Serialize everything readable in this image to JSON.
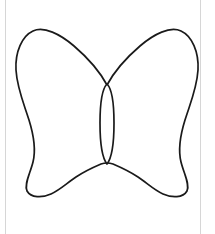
{
  "page": {
    "background_color": "#ffffff",
    "width": 215,
    "height": 234,
    "rule_color": "#d6d6d6",
    "rule_left_x": 5,
    "rule_right_x": 200
  },
  "figure": {
    "name": "butterfly-outline",
    "stroke_color": "#1a1a1a",
    "fill_color": "#ffffff",
    "stroke_width": 1.7,
    "viewbox": "0 0 215 234",
    "parts": [
      {
        "name": "wings",
        "label": "Butterfly wings outline",
        "path": "M 107 85 C 100 72 88 58 74 46 C 60 34 44 26 33 31 C 22 36 15 52 16 70 C 17 88 24 104 29 120 C 34 136 36 150 33 162 C 30 174 24 184 27 191 C 31 198 42 198 51 194 C 60 190 67 183 76 177 C 85 171 94 167 101 164 C 104 163 106 163 107 163 C 108 163 110 163 113 164 C 120 167 129 171 138 177 C 147 183 154 190 163 194 C 172 198 183 198 187 191 C 190 184 184 174 181 162 C 178 150 180 136 185 120 C 190 104 197 88 198 70 C 199 52 192 36 181 31 C 170 26 154 34 140 46 C 126 58 114 72 107 85 Z"
      },
      {
        "name": "body",
        "label": "Butterfly body (thorax and abdomen)",
        "path": "M 107 84 C 111 88 114 100 114 123 C 114 146 111 159 107 164 C 103 159 100 146 100 123 C 100 100 103 88 107 84 Z"
      }
    ],
    "anchors": {
      "left_wing_tip": [
        33,
        31
      ],
      "right_wing_tip": [
        175,
        31
      ],
      "left_lower_tip": [
        42,
        196
      ],
      "right_lower_tip": [
        172,
        196
      ],
      "body_top": [
        107,
        85
      ],
      "body_bottom": [
        107,
        164
      ],
      "body_width": 13
    }
  }
}
